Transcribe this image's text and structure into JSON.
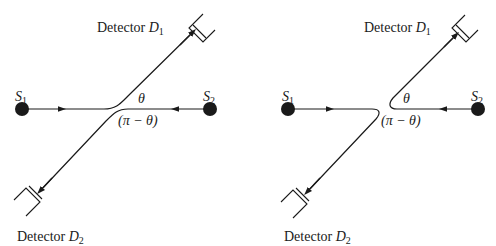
{
  "diagrams": [
    {
      "id": "left",
      "source1": {
        "label": "S",
        "sub": "1"
      },
      "source2": {
        "label": "S",
        "sub": "2"
      },
      "detector1": {
        "text": "Detector ",
        "var": "D",
        "sub": "1"
      },
      "detector2": {
        "text": "Detector ",
        "var": "D",
        "sub": "2"
      },
      "angle1": "θ",
      "angle2": "(π − θ)"
    },
    {
      "id": "right",
      "source1": {
        "label": "S",
        "sub": "1"
      },
      "source2": {
        "label": "S",
        "sub": "2"
      },
      "detector1": {
        "text": "Detector ",
        "var": "D",
        "sub": "1"
      },
      "detector2": {
        "text": "Detector ",
        "var": "D",
        "sub": "2"
      },
      "angle1": "θ",
      "angle2": "(π − θ)"
    }
  ],
  "colors": {
    "ink": "#1a1a1a",
    "background": "#ffffff"
  }
}
